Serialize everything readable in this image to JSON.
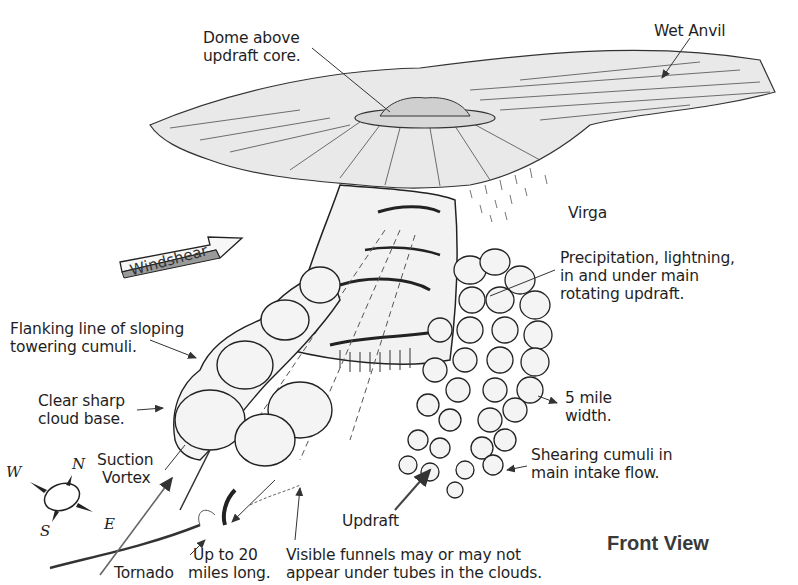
{
  "diagram": {
    "title": "Front View",
    "labels": {
      "dome": [
        "Dome above",
        "updraft core."
      ],
      "wet_anvil": "Wet Anvil",
      "virga": "Virga",
      "precipitation": [
        "Precipitation, lightning,",
        "in and under main",
        "rotating updraft."
      ],
      "windshear": "Windshear",
      "flanking_line": [
        "Flanking line of sloping",
        "towering cumuli."
      ],
      "cloud_base": [
        "Clear sharp",
        "cloud base."
      ],
      "five_mile": [
        "5 mile",
        "width."
      ],
      "suction_vortex": [
        "Suction",
        "Vortex"
      ],
      "shearing_cumuli": [
        "Shearing cumuli in",
        "main intake flow."
      ],
      "updraft": "Updraft",
      "up_to_20": [
        "Up to 20",
        "miles long."
      ],
      "visible_funnels": [
        "Visible funnels may or may not",
        "appear under tubes in the clouds."
      ],
      "tornado": "Tornado"
    },
    "compass": {
      "n": "N",
      "e": "E",
      "s": "S",
      "w": "W"
    },
    "colors": {
      "ink": "#1f1f1f",
      "background": "#ffffff",
      "title": "#3a3a3a",
      "shade": "#9a9a9a"
    }
  }
}
